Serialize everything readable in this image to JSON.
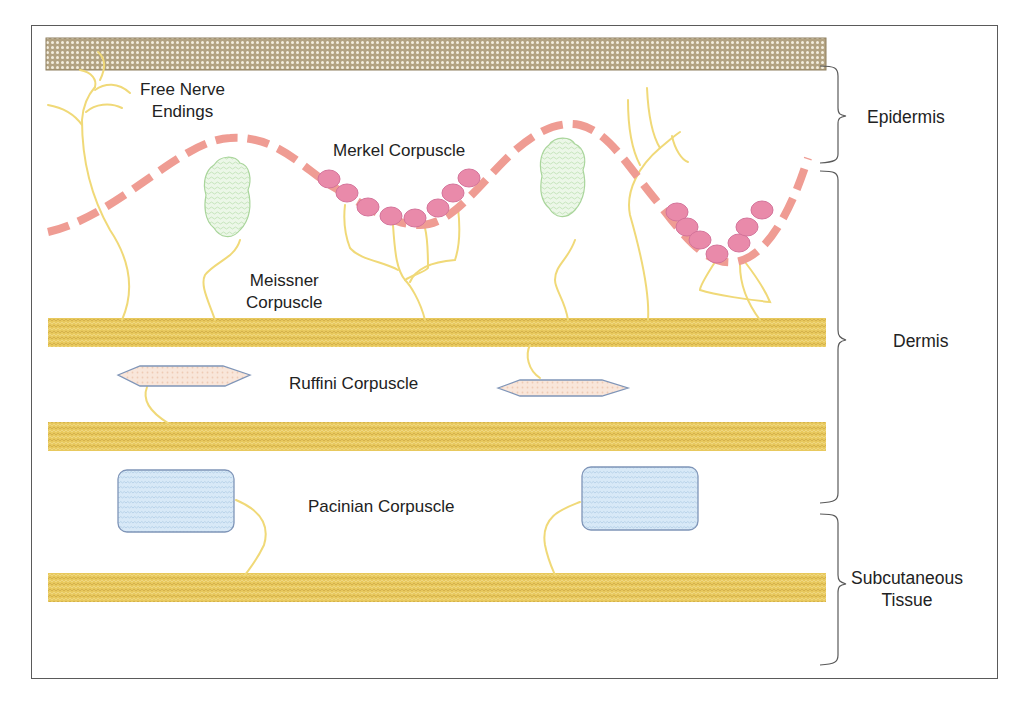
{
  "figure": {
    "colors": {
      "frame": "#5a5a5a",
      "stratum_corneum": "#b8a98a",
      "stratum_dots": "#f4efe2",
      "tissue_band": "#e6c65a",
      "tissue_band_light": "#f2dc8c",
      "basal_membrane_dash": "#ee9a90",
      "merkel_cell": "#e88aa8",
      "merkel_cell_stroke": "#d2709a",
      "nerve_fiber": "#f1dc7c",
      "meissner_fill": "#e7f5e2",
      "meissner_stroke": "#a9d59b",
      "ruffini_fill": "#f8e3d6",
      "ruffini_stroke": "#7f95b8",
      "pacinian_fill": "#d6e8f6",
      "pacinian_stroke": "#7f95b8",
      "bracket": "#555555"
    }
  },
  "labels": {
    "free_nerve_endings": [
      "Free Nerve",
      "Endings"
    ],
    "merkel": "Merkel Corpuscle",
    "meissner": [
      "Meissner",
      "Corpuscle"
    ],
    "ruffini": "Ruffini Corpuscle",
    "pacinian": "Pacinian Corpuscle"
  },
  "regions": [
    {
      "name": "Epidermis",
      "lines": [
        "Epidermis"
      ]
    },
    {
      "name": "Dermis",
      "lines": [
        "Dermis"
      ]
    },
    {
      "name": "Subcutaneous Tissue",
      "lines": [
        "Subcutaneous",
        "Tissue"
      ]
    }
  ]
}
